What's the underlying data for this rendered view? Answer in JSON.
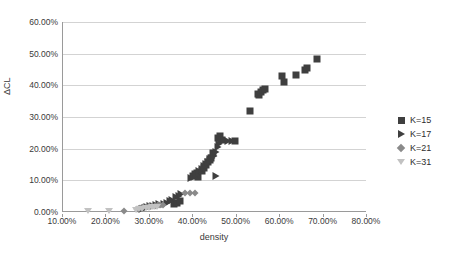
{
  "chart_data": {
    "type": "scatter",
    "title": "",
    "xlabel": "density",
    "ylabel": "ΔCL",
    "xlim": [
      0.1,
      0.8
    ],
    "ylim": [
      0.0,
      0.6
    ],
    "grid": true,
    "legend_position": "right",
    "x_tick_labels": [
      "10.00%",
      "20.00%",
      "30.00%",
      "40.00%",
      "50.00%",
      "60.00%",
      "70.00%",
      "80.00%"
    ],
    "x_tick_values": [
      0.1,
      0.2,
      0.3,
      0.4,
      0.5,
      0.6,
      0.7,
      0.8
    ],
    "y_tick_labels": [
      "0.00%",
      "10.00%",
      "20.00%",
      "30.00%",
      "40.00%",
      "50.00%",
      "60.00%"
    ],
    "y_tick_values": [
      0.0,
      0.1,
      0.2,
      0.3,
      0.4,
      0.5,
      0.6
    ],
    "series": [
      {
        "name": "K=15",
        "marker": "square",
        "color": "#3f3f3f",
        "points": [
          [
            0.355,
            0.025
          ],
          [
            0.362,
            0.03
          ],
          [
            0.37,
            0.034
          ],
          [
            0.399,
            0.115
          ],
          [
            0.404,
            0.119
          ],
          [
            0.408,
            0.124
          ],
          [
            0.412,
            0.112
          ],
          [
            0.42,
            0.131
          ],
          [
            0.424,
            0.14
          ],
          [
            0.43,
            0.149
          ],
          [
            0.434,
            0.158
          ],
          [
            0.438,
            0.163
          ],
          [
            0.441,
            0.172
          ],
          [
            0.446,
            0.185
          ],
          [
            0.458,
            0.234
          ],
          [
            0.461,
            0.24
          ],
          [
            0.466,
            0.228
          ],
          [
            0.497,
            0.224
          ],
          [
            0.53,
            0.32
          ],
          [
            0.548,
            0.372
          ],
          [
            0.552,
            0.368
          ],
          [
            0.556,
            0.38
          ],
          [
            0.56,
            0.384
          ],
          [
            0.566,
            0.388
          ],
          [
            0.604,
            0.428
          ],
          [
            0.609,
            0.412
          ],
          [
            0.637,
            0.434
          ],
          [
            0.657,
            0.45
          ],
          [
            0.661,
            0.456
          ],
          [
            0.686,
            0.483
          ]
        ]
      },
      {
        "name": "K=17",
        "marker": "triangle-right",
        "color": "#3f3f3f",
        "points": [
          [
            0.281,
            0.011
          ],
          [
            0.288,
            0.014
          ],
          [
            0.294,
            0.017
          ],
          [
            0.3,
            0.019
          ],
          [
            0.308,
            0.02
          ],
          [
            0.315,
            0.022
          ],
          [
            0.322,
            0.024
          ],
          [
            0.333,
            0.026
          ],
          [
            0.34,
            0.03
          ],
          [
            0.346,
            0.034
          ],
          [
            0.352,
            0.038
          ],
          [
            0.36,
            0.046
          ],
          [
            0.366,
            0.052
          ],
          [
            0.372,
            0.057
          ],
          [
            0.395,
            0.107
          ],
          [
            0.401,
            0.112
          ],
          [
            0.406,
            0.118
          ],
          [
            0.414,
            0.128
          ],
          [
            0.419,
            0.135
          ],
          [
            0.425,
            0.145
          ],
          [
            0.43,
            0.152
          ],
          [
            0.434,
            0.158
          ],
          [
            0.438,
            0.166
          ],
          [
            0.443,
            0.172
          ],
          [
            0.447,
            0.178
          ],
          [
            0.452,
            0.19
          ],
          [
            0.456,
            0.206
          ],
          [
            0.46,
            0.216
          ],
          [
            0.464,
            0.222
          ],
          [
            0.452,
            0.114
          ],
          [
            0.47,
            0.226
          ],
          [
            0.479,
            0.225
          ],
          [
            0.489,
            0.224
          ]
        ]
      },
      {
        "name": "K=21",
        "marker": "diamond",
        "color": "#8a8a8a",
        "points": [
          [
            0.24,
            0.002
          ],
          [
            0.27,
            0.008
          ],
          [
            0.278,
            0.012
          ],
          [
            0.285,
            0.015
          ],
          [
            0.292,
            0.016
          ],
          [
            0.299,
            0.018
          ],
          [
            0.306,
            0.019
          ],
          [
            0.312,
            0.02
          ],
          [
            0.318,
            0.021
          ],
          [
            0.324,
            0.022
          ],
          [
            0.33,
            0.023
          ],
          [
            0.382,
            0.06
          ],
          [
            0.392,
            0.06
          ],
          [
            0.404,
            0.059
          ]
        ]
      },
      {
        "name": "K=31",
        "marker": "triangle-down",
        "color": "#c2c2c2",
        "points": [
          [
            0.158,
            0.002
          ],
          [
            0.205,
            0.003
          ],
          [
            0.268,
            0.006
          ],
          [
            0.276,
            0.008
          ],
          [
            0.283,
            0.01
          ],
          [
            0.29,
            0.012
          ],
          [
            0.297,
            0.014
          ],
          [
            0.304,
            0.015
          ],
          [
            0.31,
            0.016
          ],
          [
            0.316,
            0.017
          ]
        ]
      }
    ]
  },
  "legend": {
    "items": [
      {
        "label": "K=15",
        "marker": "square"
      },
      {
        "label": "K=17",
        "marker": "triangle-right"
      },
      {
        "label": "K=21",
        "marker": "diamond"
      },
      {
        "label": "K=31",
        "marker": "triangle-down"
      }
    ]
  }
}
